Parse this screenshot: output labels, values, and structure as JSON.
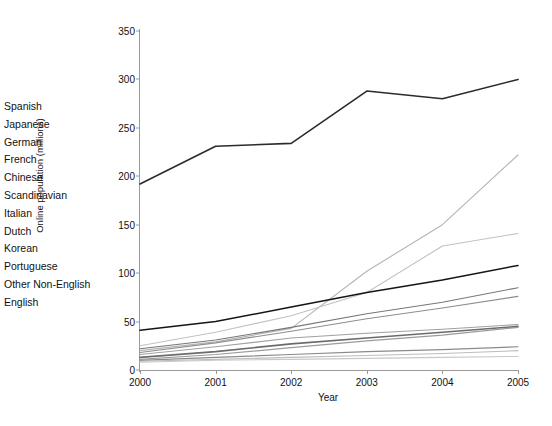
{
  "chart_data": {
    "type": "line",
    "title": "",
    "xlabel": "Year",
    "ylabel": "Online population (millions)",
    "x": [
      2000,
      2001,
      2002,
      2003,
      2004,
      2005
    ],
    "xtick_labels": [
      "2000",
      "2001",
      "2002",
      "2003",
      "2004",
      "2005"
    ],
    "ytick_labels": [
      "0",
      "50",
      "100",
      "150",
      "200",
      "250",
      "300",
      "350"
    ],
    "xlim": [
      2000,
      2005
    ],
    "ylim": [
      0,
      350
    ],
    "ytick_step": 50,
    "grid": false,
    "legend_position": "left-outside",
    "series": [
      {
        "name": "Spanish",
        "color": "#b4b4b4",
        "width": 1.1,
        "values": [
          20,
          29,
          43,
          102,
          150,
          222
        ]
      },
      {
        "name": "Japanese",
        "color": "#c2c2c2",
        "width": 1.1,
        "values": [
          25,
          39,
          56,
          80,
          128,
          141
        ]
      },
      {
        "name": "German",
        "color": "#151515",
        "width": 1.5,
        "values": [
          41,
          50,
          65,
          80,
          93,
          108
        ]
      },
      {
        "name": "French",
        "color": "#777777",
        "width": 1.1,
        "values": [
          22,
          31,
          44,
          58,
          70,
          85
        ]
      },
      {
        "name": "Chinese",
        "color": "#8e8e8e",
        "width": 1.1,
        "values": [
          18,
          28,
          40,
          53,
          64,
          76
        ]
      },
      {
        "name": "Scandinavian",
        "color": "#a0a0a0",
        "width": 1.1,
        "values": [
          16,
          24,
          33,
          38,
          42,
          47
        ]
      },
      {
        "name": "Italian",
        "color": "#6b6b6b",
        "width": 1.6,
        "values": [
          13,
          19,
          27,
          33,
          39,
          45
        ]
      },
      {
        "name": "Dutch",
        "color": "#9b9b9b",
        "width": 1.2,
        "values": [
          11,
          16,
          23,
          30,
          36,
          44
        ]
      },
      {
        "name": "Korean",
        "color": "#8a8a8a",
        "width": 1.2,
        "values": [
          10,
          13,
          16,
          19,
          21,
          24
        ]
      },
      {
        "name": "Portuguese",
        "color": "#bdbdbd",
        "width": 1.1,
        "values": [
          9,
          11,
          13,
          15,
          17,
          20
        ]
      },
      {
        "name": "Other Non-English",
        "color": "#c9c9c9",
        "width": 1.1,
        "values": [
          8,
          10,
          11,
          12,
          13,
          14
        ]
      },
      {
        "name": "English",
        "color": "#2b2b2b",
        "width": 1.6,
        "values": [
          192,
          231,
          234,
          288,
          280,
          300
        ]
      }
    ]
  },
  "legend": {
    "items": [
      "Spanish",
      "Japanese",
      "German",
      "French",
      "Chinese",
      "Scandinavian",
      "Italian",
      "Dutch",
      "Korean",
      "Portuguese",
      "Other Non-English",
      "English"
    ]
  }
}
